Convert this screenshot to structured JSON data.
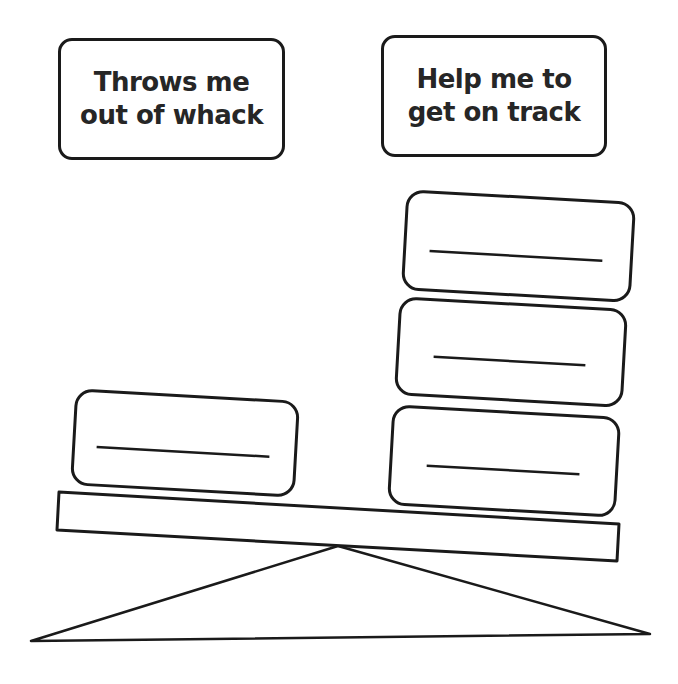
{
  "labels": {
    "left": "Throws me\nout of whack",
    "right": "Help me to\nget on track"
  },
  "scale": {
    "left_blocks": [
      {
        "blank_line": true
      }
    ],
    "right_blocks": [
      {
        "blank_line": true
      },
      {
        "blank_line": true
      },
      {
        "blank_line": true
      }
    ],
    "tilt": "right side lower"
  },
  "colors": {
    "stroke": "#1a1a1a",
    "text": "#262626",
    "background": "#ffffff"
  }
}
